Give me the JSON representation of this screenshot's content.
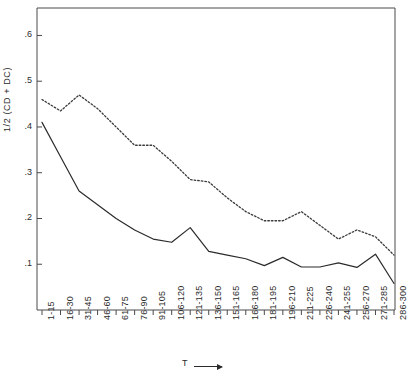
{
  "chart_data": {
    "type": "line",
    "title": "",
    "subtitle": "",
    "ylabel": "1/2 (CD + DC)",
    "xlabel": "T",
    "xlabel_arrow": "⟶",
    "grid": false,
    "legend": "none",
    "ylim": [
      0.0,
      0.66
    ],
    "ytick_labels": [
      ".6",
      ".5",
      ".4",
      ".3",
      ".2",
      ".1"
    ],
    "ytick_values": [
      0.6,
      0.5,
      0.4,
      0.3,
      0.2,
      0.1
    ],
    "categories": [
      "1-15",
      "16-30",
      "31-45",
      "46-60",
      "61-75",
      "76-90",
      "91-105",
      "106-120",
      "121-135",
      "136-150",
      "151-165",
      "166-180",
      "181-195",
      "196-210",
      "211-225",
      "226-240",
      "241-255",
      "256-270",
      "271-285",
      "286-300"
    ],
    "series": [
      {
        "name": "upper-dotted-curve",
        "style": "dotted",
        "color": "#3a3a3a",
        "values": [
          0.46,
          0.435,
          0.47,
          0.44,
          0.4,
          0.36,
          0.36,
          0.325,
          0.285,
          0.28,
          0.245,
          0.215,
          0.195,
          0.195,
          0.215,
          0.185,
          0.155,
          0.175,
          0.16,
          0.12
        ]
      },
      {
        "name": "lower-solid-curve",
        "style": "solid",
        "color": "#2b2b2b",
        "values": [
          0.41,
          0.335,
          0.26,
          0.23,
          0.2,
          0.175,
          0.155,
          0.148,
          0.18,
          0.128,
          0.12,
          0.112,
          0.097,
          0.115,
          0.094,
          0.094,
          0.103,
          0.093,
          0.122,
          0.058
        ]
      }
    ]
  },
  "frame": {
    "left": 37,
    "right": 395,
    "top": 8,
    "bottom": 310
  },
  "colors": {
    "axis": "#4a4a4a",
    "text": "#2b2b2b",
    "background": "#ffffff"
  }
}
